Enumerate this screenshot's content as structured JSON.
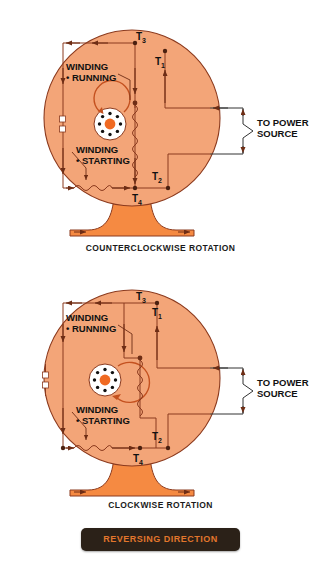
{
  "page": {
    "background": "#ffffff",
    "motor_body_color": "#F3A578",
    "motor_base_color": "#F58A42",
    "line_color": "#8B3A1E",
    "text_color": "#1A1A1A"
  },
  "diagrams": [
    {
      "id": "counterclockwise",
      "caption": "COUNTERCLOCKWISE ROTATION",
      "rotation": "counterclockwise",
      "terminals": [
        {
          "name": "T3",
          "base": "T",
          "sub": "3"
        },
        {
          "name": "T1",
          "base": "T",
          "sub": "1"
        },
        {
          "name": "T2",
          "base": "T",
          "sub": "2"
        },
        {
          "name": "T4",
          "base": "T",
          "sub": "4"
        }
      ],
      "windings": [
        {
          "line1": "WINDING",
          "line2": "• RUNNING"
        },
        {
          "line1": "WINDING",
          "line2": "• STARTING"
        }
      ],
      "power_label": {
        "line1": "TO POWER",
        "line2": "SOURCE"
      }
    },
    {
      "id": "clockwise",
      "caption": "CLOCKWISE ROTATION",
      "rotation": "clockwise",
      "terminals": [
        {
          "name": "T3",
          "base": "T",
          "sub": "3"
        },
        {
          "name": "T1",
          "base": "T",
          "sub": "1"
        },
        {
          "name": "T2",
          "base": "T",
          "sub": "2"
        },
        {
          "name": "T4",
          "base": "T",
          "sub": "4"
        }
      ],
      "windings": [
        {
          "line1": "WINDING",
          "line2": "• RUNNING"
        },
        {
          "line1": "WINDING",
          "line2": "• STARTING"
        }
      ],
      "power_label": {
        "line1": "TO POWER",
        "line2": "SOURCE"
      }
    }
  ],
  "footer_button": {
    "label": "REVERSING DIRECTION",
    "background": "#2B2118",
    "text_color": "#E2762C"
  }
}
